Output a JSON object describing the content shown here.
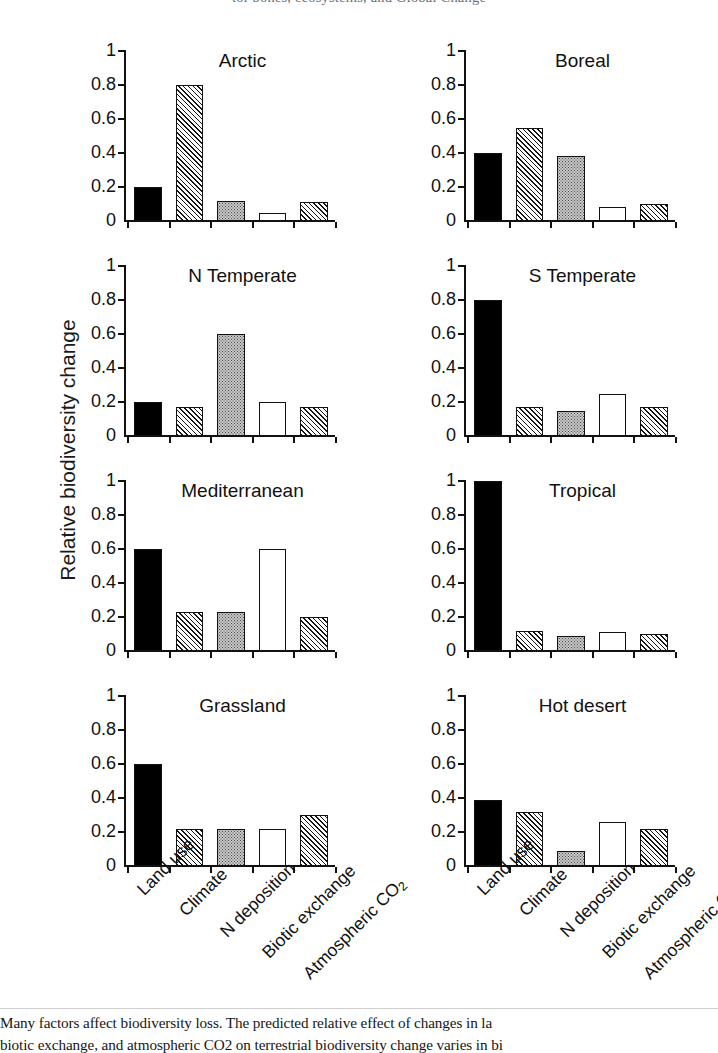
{
  "header": {
    "clipped_line": "tor bones, ecosystems, and Global Change"
  },
  "axis": {
    "ylabel": "Relative biodiversity change",
    "yticks": [
      "0",
      "0.2",
      "0.4",
      "0.6",
      "0.8",
      "1"
    ],
    "ylim": [
      0,
      1
    ]
  },
  "caption": {
    "line1": "Many factors affect biodiversity loss. The predicted relative effect of changes in la",
    "line2": "biotic exchange, and atmospheric CO2 on terrestrial biodiversity change varies in bi"
  },
  "chart_data": {
    "type": "bar",
    "xlabel": "",
    "ylabel": "Relative biodiversity change",
    "ylim": [
      0,
      1
    ],
    "yticks": [
      0,
      0.2,
      0.4,
      0.6,
      0.8,
      1
    ],
    "grid": false,
    "legend": "none",
    "categories": [
      "Land use",
      "Climate",
      "N deposition",
      "Biotic exchange",
      "Atmospheric CO2"
    ],
    "category_fills": [
      "black",
      "hatch",
      "dots",
      "white",
      "hatch"
    ],
    "panels": [
      {
        "name": "Arctic",
        "values": [
          0.2,
          0.8,
          0.12,
          0.05,
          0.11
        ]
      },
      {
        "name": "Boreal",
        "values": [
          0.4,
          0.55,
          0.38,
          0.08,
          0.1
        ]
      },
      {
        "name": "N Temperate",
        "values": [
          0.2,
          0.17,
          0.6,
          0.2,
          0.17
        ]
      },
      {
        "name": "S Temperate",
        "values": [
          0.8,
          0.17,
          0.15,
          0.25,
          0.17
        ]
      },
      {
        "name": "Mediterranean",
        "values": [
          0.6,
          0.23,
          0.23,
          0.6,
          0.2
        ]
      },
      {
        "name": "Tropical",
        "values": [
          1.0,
          0.12,
          0.09,
          0.11,
          0.1
        ]
      },
      {
        "name": "Grassland",
        "values": [
          0.6,
          0.22,
          0.22,
          0.22,
          0.3
        ]
      },
      {
        "name": "Hot desert",
        "values": [
          0.39,
          0.32,
          0.09,
          0.26,
          0.22
        ]
      }
    ]
  }
}
